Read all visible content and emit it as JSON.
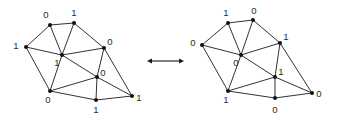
{
  "figure": {
    "background_color": "#ffffff",
    "ink_color": "#1b1b1b",
    "label_color": "#2a2a2a",
    "width": 337,
    "height": 121
  },
  "chart_data": {
    "type": "diagram",
    "title": "",
    "graphs": [
      {
        "name": "left-graph",
        "vertices": [
          {
            "id": "L1",
            "label": "0",
            "x": 50,
            "y": 25,
            "label_x": 46,
            "label_y": 15
          },
          {
            "id": "L2",
            "label": "1",
            "x": 74,
            "y": 23,
            "label_x": 74,
            "label_y": 13
          },
          {
            "id": "L3",
            "label": "1",
            "x": 26,
            "y": 47,
            "label_x": 16,
            "label_y": 46
          },
          {
            "id": "L4",
            "label": "0",
            "x": 104,
            "y": 48,
            "label_x": 110,
            "label_y": 42
          },
          {
            "id": "L5",
            "label": "1",
            "x": 62,
            "y": 55,
            "label_x": 57,
            "label_y": 63
          },
          {
            "id": "L6",
            "label": "0",
            "x": 97,
            "y": 77,
            "label_x": 103,
            "label_y": 73
          },
          {
            "id": "L7",
            "label": "0",
            "x": 50,
            "y": 91,
            "label_x": 48,
            "label_y": 100
          },
          {
            "id": "L8",
            "label": "1",
            "x": 96,
            "y": 100,
            "label_x": 96,
            "label_y": 110
          },
          {
            "id": "L9",
            "label": "1",
            "x": 132,
            "y": 96,
            "label_x": 139,
            "label_y": 98
          }
        ],
        "edges": [
          [
            "L1",
            "L2"
          ],
          [
            "L1",
            "L3"
          ],
          [
            "L1",
            "L5"
          ],
          [
            "L2",
            "L5"
          ],
          [
            "L2",
            "L4"
          ],
          [
            "L3",
            "L5"
          ],
          [
            "L3",
            "L7"
          ],
          [
            "L4",
            "L5"
          ],
          [
            "L4",
            "L6"
          ],
          [
            "L4",
            "L9"
          ],
          [
            "L5",
            "L6"
          ],
          [
            "L5",
            "L7"
          ],
          [
            "L6",
            "L7"
          ],
          [
            "L6",
            "L8"
          ],
          [
            "L6",
            "L9"
          ],
          [
            "L7",
            "L8"
          ],
          [
            "L8",
            "L9"
          ]
        ]
      },
      {
        "name": "right-graph",
        "vertices": [
          {
            "id": "R1",
            "label": "1",
            "x": 228,
            "y": 23,
            "label_x": 226,
            "label_y": 13
          },
          {
            "id": "R2",
            "label": "0",
            "x": 253,
            "y": 20,
            "label_x": 254,
            "label_y": 11
          },
          {
            "id": "R3",
            "label": "0",
            "x": 202,
            "y": 45,
            "label_x": 193,
            "label_y": 43
          },
          {
            "id": "R4",
            "label": "1",
            "x": 280,
            "y": 43,
            "label_x": 286,
            "label_y": 37
          },
          {
            "id": "R5",
            "label": "0",
            "x": 241,
            "y": 55,
            "label_x": 236,
            "label_y": 63
          },
          {
            "id": "R6",
            "label": "1",
            "x": 275,
            "y": 77,
            "label_x": 281,
            "label_y": 72
          },
          {
            "id": "R7",
            "label": "1",
            "x": 228,
            "y": 91,
            "label_x": 226,
            "label_y": 100
          },
          {
            "id": "R8",
            "label": "0",
            "x": 275,
            "y": 98,
            "label_x": 275,
            "label_y": 110
          },
          {
            "id": "R9",
            "label": "0",
            "x": 312,
            "y": 93,
            "label_x": 319,
            "label_y": 94
          }
        ],
        "edges": [
          [
            "R1",
            "R2"
          ],
          [
            "R1",
            "R3"
          ],
          [
            "R1",
            "R5"
          ],
          [
            "R2",
            "R5"
          ],
          [
            "R2",
            "R4"
          ],
          [
            "R3",
            "R5"
          ],
          [
            "R3",
            "R7"
          ],
          [
            "R4",
            "R5"
          ],
          [
            "R4",
            "R6"
          ],
          [
            "R4",
            "R9"
          ],
          [
            "R5",
            "R6"
          ],
          [
            "R5",
            "R7"
          ],
          [
            "R6",
            "R7"
          ],
          [
            "R6",
            "R8"
          ],
          [
            "R6",
            "R9"
          ],
          [
            "R7",
            "R8"
          ],
          [
            "R8",
            "R9"
          ]
        ]
      }
    ],
    "connector": {
      "name": "double-arrow",
      "symbol": "⟷",
      "x1": 147,
      "x2": 184,
      "y": 61,
      "head_size": 5
    },
    "vertex_radius": 2.0,
    "label_values": [
      "0",
      "1"
    ]
  }
}
